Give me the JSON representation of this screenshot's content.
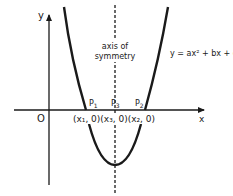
{
  "diagram": {
    "type": "parabola-graph",
    "equation_label": "y = ax² + bx + c",
    "axes": {
      "x_label": "x",
      "y_label": "y",
      "origin_label": "O"
    },
    "axis_of_symmetry": {
      "line1": "axis of",
      "line2": "symmetry"
    },
    "points": [
      {
        "name": "P1",
        "label": "P",
        "sub": "1",
        "coord": "(x₁, 0)"
      },
      {
        "name": "P3",
        "label": "P",
        "sub": "3",
        "coord": "(x₃, 0)"
      },
      {
        "name": "P2",
        "label": "P",
        "sub": "2",
        "coord": "(x₂, 0)"
      }
    ],
    "coords_label": "(x₁, 0)(x₃, 0)(x₂, 0)",
    "colors": {
      "ink": "#1a1a1a",
      "background": "#ffffff"
    }
  }
}
